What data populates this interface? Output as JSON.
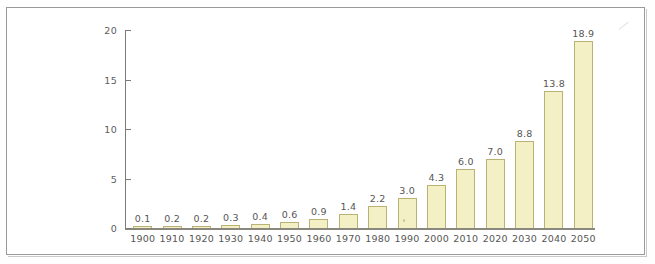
{
  "chart_data": {
    "type": "bar",
    "title": "",
    "subtitle": "",
    "xlabel": "",
    "ylabel": "",
    "categories": [
      "1900",
      "1910",
      "1920",
      "1930",
      "1940",
      "1950",
      "1960",
      "1970",
      "1980",
      "1990",
      "2000",
      "2010",
      "2020",
      "2030",
      "2040",
      "2050"
    ],
    "values": [
      0.1,
      0.2,
      0.2,
      0.3,
      0.4,
      0.6,
      0.9,
      1.4,
      2.2,
      3.0,
      4.3,
      6.0,
      7.0,
      8.8,
      13.8,
      18.9
    ],
    "data_labels": [
      "0.1",
      "0.2",
      "0.2",
      "0.3",
      "0.4",
      "0.6",
      "0.9",
      "1.4",
      "2.2",
      "3.0",
      "4.3",
      "6.0",
      "7.0",
      "8.8",
      "13.8",
      "18.9"
    ],
    "ylim": [
      0,
      20
    ],
    "yticks": [
      0,
      5,
      10,
      15,
      20
    ],
    "ytick_labels": [
      "0",
      "5",
      "10",
      "15",
      "20"
    ],
    "grid": false,
    "legend": null,
    "series": [
      {
        "name": "",
        "values": [
          0.1,
          0.2,
          0.2,
          0.3,
          0.4,
          0.6,
          0.9,
          1.4,
          2.2,
          3.0,
          4.3,
          6.0,
          7.0,
          8.8,
          13.8,
          18.9
        ]
      }
    ],
    "colors": {
      "bar_fill": "#f2f0c4",
      "bar_stroke": "#b9b274",
      "axis": "#7b7b79",
      "text": "#565654",
      "frame": "#9a9a9e",
      "background": "#ffffff"
    }
  }
}
